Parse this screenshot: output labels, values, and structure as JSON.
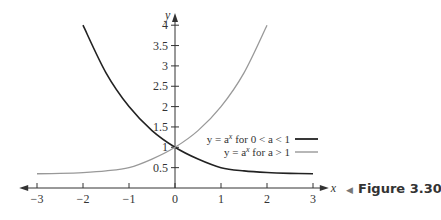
{
  "chart_data": {
    "type": "line",
    "title": "",
    "xlabel": "x",
    "ylabel": "y",
    "xlim": [
      -3.3,
      3.3
    ],
    "ylim": [
      0,
      4.3
    ],
    "grid": false,
    "x_ticks": [
      -3,
      -2,
      -1,
      0,
      1,
      2,
      3
    ],
    "x_tick_labels": [
      "−3",
      "−2",
      "−1",
      "0",
      "1",
      "2",
      "3"
    ],
    "y_ticks": [
      0.5,
      1,
      1.5,
      2,
      2.5,
      3,
      3.5,
      4
    ],
    "y_tick_labels": [
      "0.5",
      "1",
      "1.5",
      "2",
      "2.5",
      "3",
      "3.5",
      "4"
    ],
    "series": [
      {
        "name": "y = a^x for 0 < a < 1",
        "color": "#222222",
        "base": 0.5,
        "x_range": [
          -2,
          3
        ],
        "x": [
          -2,
          -1.5,
          -1,
          -0.5,
          0,
          0.5,
          1,
          1.5,
          2,
          2.5,
          3
        ],
        "y": [
          4,
          2.83,
          2,
          1.41,
          1,
          0.71,
          0.5,
          0.42,
          0.38,
          0.36,
          0.35
        ]
      },
      {
        "name": "y = a^x for a > 1",
        "color": "#999999",
        "base": 2,
        "x_range": [
          -3,
          2.05
        ],
        "x": [
          -3,
          -2.5,
          -2,
          -1.5,
          -1,
          -0.5,
          0,
          0.5,
          1,
          1.5,
          2
        ],
        "y": [
          0.35,
          0.36,
          0.38,
          0.42,
          0.5,
          0.71,
          1,
          1.41,
          2,
          2.83,
          4
        ]
      }
    ],
    "legend": {
      "placement": "center-right",
      "entries": [
        {
          "text_prefix": "y = a",
          "sup": "x",
          "text_suffix": " for  0 < a < 1",
          "color": "#222222"
        },
        {
          "text_prefix": "y = a",
          "sup": "x",
          "text_suffix": " for  a > 1",
          "color": "#999999"
        }
      ]
    },
    "annotation": "Figure 3.30"
  },
  "figure_label": "Figure 3.30",
  "figure_marker": "◀"
}
